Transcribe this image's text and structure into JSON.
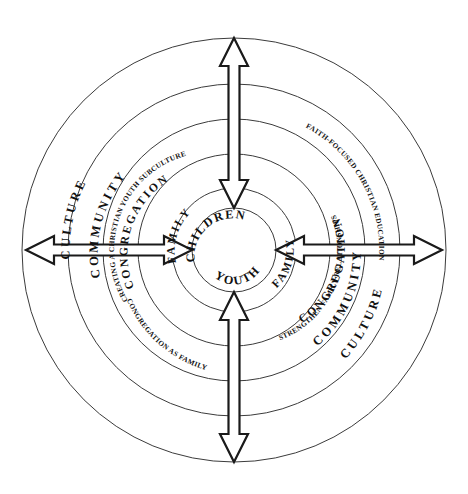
{
  "figure": {
    "type": "concentric-ecology-diagram",
    "background_color": "#ffffff",
    "line_color": "#3b3b3b",
    "text_color": "#111111",
    "center": {
      "x": 234,
      "y": 250
    },
    "ring_radii": [
      42,
      62,
      96,
      131,
      166,
      212
    ]
  },
  "center_circle": {
    "label_upper": "CHILDREN",
    "label_lower": "YOUTH"
  },
  "rings": {
    "family_ring": {
      "label_left": "FAMILY",
      "label_right": "FAMILY"
    },
    "congregation_ring": {
      "label_left": "CONGREGATION",
      "label_right": "CONGREGATION"
    },
    "community_ring": {
      "label_left": "COMMUNITY",
      "label_right": "COMMUNITY"
    },
    "culture_ring": {
      "label_left": "CULTURE",
      "label_right": "CULTURE"
    }
  },
  "strategy_labels": {
    "top_left": "CREATING A CHRISTIAN YOUTH SUBCULTURE",
    "top_right": "FAITH-FOCUSED CHRISTIAN EDUCATION",
    "bottom_left": "CONGREGATION AS FAMILY",
    "bottom_right": "STRENGTHEN FAMILY RELATIONSHIPS"
  },
  "arrows": [
    {
      "name": "arrow-top",
      "direction": "vertical-double",
      "from": "outer-edge",
      "to": "center"
    },
    {
      "name": "arrow-bottom",
      "direction": "vertical-double",
      "from": "outer-edge",
      "to": "center"
    },
    {
      "name": "arrow-left",
      "direction": "horizontal-double",
      "from": "outer-edge",
      "to": "center"
    },
    {
      "name": "arrow-right",
      "direction": "horizontal-double",
      "from": "outer-edge",
      "to": "center"
    }
  ]
}
